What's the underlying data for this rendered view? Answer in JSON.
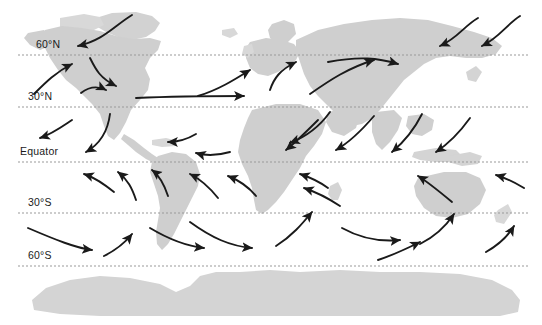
{
  "figure": {
    "width": 542,
    "height": 325,
    "background_color": "#ffffff"
  },
  "colors": {
    "land": "#cfcfcf",
    "land_light": "#dedede",
    "antarctica": "#d4d4d4",
    "latitude_line": "#999999",
    "arrow": "#1a1a1a",
    "label_text": "#1a1a1a"
  },
  "latitude_lines": [
    {
      "id": "lat-60n",
      "label": "60°N",
      "y": 55,
      "label_x": 36,
      "label_y": 39
    },
    {
      "id": "lat-30n",
      "label": "30°N",
      "y": 107,
      "label_x": 28,
      "label_y": 91
    },
    {
      "id": "lat-eq",
      "label": "Equator",
      "y": 162,
      "label_x": 20,
      "label_y": 146
    },
    {
      "id": "lat-30s",
      "label": "30°S",
      "y": 213,
      "label_x": 28,
      "label_y": 197
    },
    {
      "id": "lat-60s",
      "label": "60°S",
      "y": 266,
      "label_x": 28,
      "label_y": 250
    }
  ],
  "arrows": {
    "count": 36,
    "style": "curved-flow-arrows",
    "description": "Curved arrows indicating prevailing global wind belts: polar easterlies, westerlies and trade winds in each hemisphere."
  },
  "landmasses": [
    {
      "name": "north-america"
    },
    {
      "name": "south-america"
    },
    {
      "name": "greenland"
    },
    {
      "name": "europe"
    },
    {
      "name": "africa"
    },
    {
      "name": "asia"
    },
    {
      "name": "australia"
    },
    {
      "name": "antarctica"
    }
  ]
}
